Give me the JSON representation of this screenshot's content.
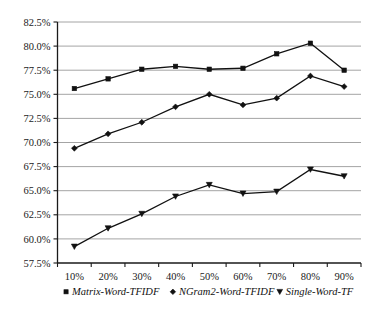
{
  "chart_data": {
    "type": "line",
    "title": "",
    "xlabel": "",
    "ylabel": "",
    "categories": [
      "10%",
      "20%",
      "30%",
      "40%",
      "50%",
      "60%",
      "70%",
      "80%",
      "90%"
    ],
    "x": [
      10,
      20,
      30,
      40,
      50,
      60,
      70,
      80,
      90
    ],
    "ylim": [
      57.5,
      82.5
    ],
    "ytick_labels": [
      "82.5%",
      "80.0%",
      "77.5%",
      "75.0%",
      "72.5%",
      "70.0%",
      "67.5%",
      "65.0%",
      "62.5%",
      "60.0%",
      "57.5%"
    ],
    "ytick_values": [
      82.5,
      80.0,
      77.5,
      75.0,
      72.5,
      70.0,
      67.5,
      65.0,
      62.5,
      60.0,
      57.5
    ],
    "grid": "horizontal",
    "legend_position": "bottom",
    "series": [
      {
        "name": "Matrix-Word-TFIDF",
        "marker": "square",
        "color": "#111111",
        "values": [
          75.6,
          76.6,
          77.6,
          77.9,
          77.6,
          77.7,
          79.2,
          80.3,
          77.5
        ]
      },
      {
        "name": "NGram2-Word-TFIDF",
        "marker": "diamond",
        "color": "#111111",
        "values": [
          69.4,
          70.9,
          72.1,
          73.7,
          75.0,
          73.9,
          74.6,
          76.9,
          75.8
        ]
      },
      {
        "name": "Single-Word-TF",
        "marker": "triangle-down",
        "color": "#111111",
        "values": [
          59.2,
          61.1,
          62.6,
          64.4,
          65.6,
          64.7,
          64.9,
          67.2,
          66.5
        ]
      }
    ]
  },
  "legend": {
    "items": [
      {
        "label": "Matrix-Word-TFIDF",
        "marker": "square"
      },
      {
        "label": "NGram2-Word-TFIDF",
        "marker": "diamond"
      },
      {
        "label": "Single-Word-TF",
        "marker": "triangle-down"
      }
    ]
  },
  "axes": {
    "y_labels": [
      "82.5%",
      "80.0%",
      "77.5%",
      "75.0%",
      "72.5%",
      "70.0%",
      "67.5%",
      "65.0%",
      "62.5%",
      "60.0%",
      "57.5%"
    ],
    "x_labels": [
      "10%",
      "20%",
      "30%",
      "40%",
      "50%",
      "60%",
      "70%",
      "80%",
      "90%"
    ]
  },
  "style": {
    "gridline_color": "#9a9a9a",
    "axis_color": "#1a1a1a",
    "series_color": "#111111",
    "background": "#ffffff"
  }
}
